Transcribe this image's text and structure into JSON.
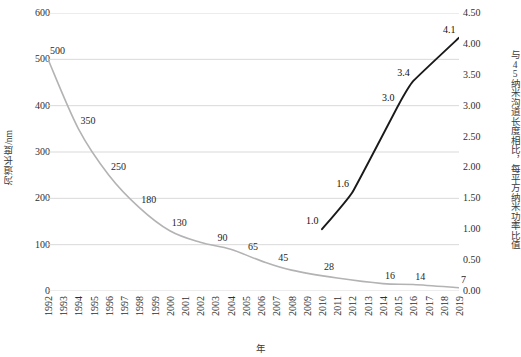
{
  "chart_data": {
    "type": "line",
    "title": "",
    "xlabel": "年",
    "ylabel": "沟道长度/nm",
    "y2label": "与45纳米沟道长度相比，每平方纳米功率比值",
    "grid": true,
    "legend": "none",
    "categories": [
      "1992",
      "1993",
      "1994",
      "1995",
      "1996",
      "1997",
      "1998",
      "1999",
      "2000",
      "2001",
      "2002",
      "2003",
      "2004",
      "2005",
      "2006",
      "2007",
      "2008",
      "2009",
      "2010",
      "2011",
      "2012",
      "2013",
      "2014",
      "2015",
      "2016",
      "2017",
      "2018",
      "2019"
    ],
    "xlim": [
      "1992",
      "2019"
    ],
    "ylim": [
      0,
      600
    ],
    "yticks": [
      "0",
      "100",
      "200",
      "300",
      "400",
      "500",
      "600"
    ],
    "y2lim": [
      0,
      4.5
    ],
    "y2ticks": [
      "0.00",
      "0.50",
      "1.00",
      "1.50",
      "2.00",
      "2.50",
      "3.00",
      "3.50",
      "4.00",
      "4.50"
    ],
    "series": [
      {
        "name": "沟道长度/nm",
        "axis": "left",
        "color": "#b3b3b3",
        "x": [
          "1992",
          "1994",
          "1996",
          "1998",
          "2000",
          "2002",
          "2004",
          "2006",
          "2008",
          "2011",
          "2014",
          "2016",
          "2019"
        ],
        "values": [
          500,
          350,
          250,
          180,
          130,
          105,
          90,
          65,
          45,
          28,
          16,
          14,
          7
        ],
        "labels": [
          {
            "x": "1992",
            "value": "500"
          },
          {
            "x": "1994",
            "value": "350"
          },
          {
            "x": "1996",
            "value": "250"
          },
          {
            "x": "1998",
            "value": "180"
          },
          {
            "x": "2000",
            "value": "130"
          },
          {
            "x": "2003",
            "value": "90"
          },
          {
            "x": "2005",
            "value": "65"
          },
          {
            "x": "2007",
            "value": "45"
          },
          {
            "x": "2010",
            "value": "28"
          },
          {
            "x": "2014",
            "value": "16"
          },
          {
            "x": "2016",
            "value": "14"
          },
          {
            "x": "2019",
            "value": "7"
          }
        ]
      },
      {
        "name": "与45纳米沟道长度相比，每平方纳米功率比值",
        "axis": "right",
        "color": "#1a1a1a",
        "x": [
          "2010",
          "2012",
          "2015",
          "2016",
          "2019"
        ],
        "values": [
          1.0,
          1.6,
          3.0,
          3.4,
          4.1
        ],
        "labels": [
          {
            "x": "2010",
            "value": "1.0"
          },
          {
            "x": "2012",
            "value": "1.6"
          },
          {
            "x": "2015",
            "value": "3.0"
          },
          {
            "x": "2016",
            "value": "3.4"
          },
          {
            "x": "2019",
            "value": "4.1"
          }
        ]
      }
    ]
  }
}
